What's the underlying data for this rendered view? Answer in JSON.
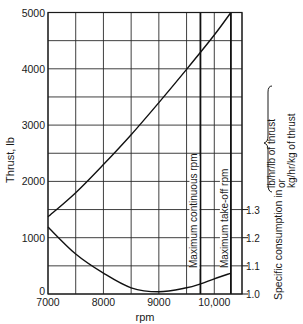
{
  "chart_data": {
    "type": "line",
    "title": "",
    "xlabel": "rpm",
    "ylabel": "Thrust, lb",
    "y2label": {
      "prefix": "Specific consumption in",
      "line1": "lb/hr/lb of thrust",
      "line2": "or",
      "line3": "kg/hr/kg of thrust"
    },
    "xlim": [
      7000,
      10500
    ],
    "ylim": [
      0,
      5000
    ],
    "y2lim": [
      1.0,
      1.3
    ],
    "x_ticks": [
      {
        "value": 7000,
        "label": "7000"
      },
      {
        "value": 8000,
        "label": "8000"
      },
      {
        "value": 9000,
        "label": "9000"
      },
      {
        "value": 10000,
        "label": "10,000"
      }
    ],
    "y_ticks": [
      {
        "value": 0,
        "label": "0"
      },
      {
        "value": 1000,
        "label": "1000"
      },
      {
        "value": 2000,
        "label": "2000"
      },
      {
        "value": 3000,
        "label": "3000"
      },
      {
        "value": 4000,
        "label": "4000"
      },
      {
        "value": 5000,
        "label": "5000"
      }
    ],
    "y2_ticks": [
      {
        "value": 1.0,
        "label": "1.0"
      },
      {
        "value": 1.1,
        "label": "1.1"
      },
      {
        "value": 1.2,
        "label": "1.2"
      },
      {
        "value": 1.3,
        "label": "1.3"
      }
    ],
    "grid": {
      "x_step": 500,
      "y_step": 500,
      "on": true
    },
    "series": [
      {
        "name": "Thrust",
        "axis": "left",
        "x": [
          7000,
          7500,
          8000,
          8500,
          9000,
          9500,
          10000,
          10300
        ],
        "values": [
          1370,
          1800,
          2300,
          2830,
          3400,
          3990,
          4600,
          5000
        ]
      },
      {
        "name": "Specific consumption",
        "axis": "right",
        "x": [
          7000,
          7500,
          8000,
          8500,
          9000,
          9500,
          9750,
          10000,
          10300
        ],
        "values": [
          1.238,
          1.142,
          1.074,
          1.022,
          1.008,
          1.022,
          1.036,
          1.054,
          1.074
        ]
      }
    ],
    "annotations": [
      {
        "type": "vline",
        "x": 9750,
        "label": "Maximum continuous rpm"
      },
      {
        "type": "vline",
        "x": 10300,
        "label": "Maximum take-off rpm"
      }
    ]
  }
}
